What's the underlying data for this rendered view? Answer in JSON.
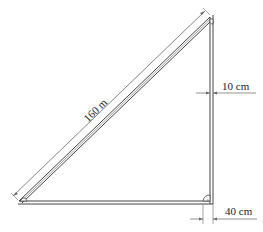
{
  "diagram": {
    "type": "right-triangle-frame",
    "labels": {
      "hypotenuse_length": "160 m",
      "vertical_member_width": "10 cm",
      "base_offset": "40 cm"
    },
    "colors": {
      "stroke": "#444444",
      "background": "#ffffff"
    }
  }
}
